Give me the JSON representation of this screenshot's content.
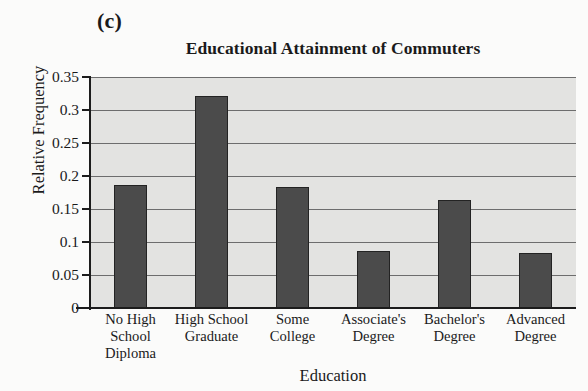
{
  "panel_letter": "(c)",
  "chart_data": {
    "type": "bar",
    "title": "Educational Attainment of Commuters",
    "xlabel": "Education",
    "ylabel": "Relative Frequency",
    "categories": [
      "No High School Diploma",
      "High School Graduate",
      "Some College",
      "Associate's Degree",
      "Bachelor's Degree",
      "Advanced Degree"
    ],
    "category_lines": [
      [
        "No High",
        "School",
        "Diploma"
      ],
      [
        "High School",
        "Graduate"
      ],
      [
        "Some",
        "College"
      ],
      [
        "Associate's",
        "Degree"
      ],
      [
        "Bachelor's",
        "Degree"
      ],
      [
        "Advanced",
        "Degree"
      ]
    ],
    "values": [
      0.187,
      0.321,
      0.184,
      0.087,
      0.163,
      0.084
    ],
    "ylim": [
      0,
      0.35
    ],
    "ytick_values": [
      0,
      0.05,
      0.1,
      0.15,
      0.2,
      0.25,
      0.3,
      0.35
    ],
    "ytick_labels": [
      "0",
      "0.05",
      "0.1",
      "0.15",
      "0.2",
      "0.25",
      "0.3",
      "0.35"
    ],
    "grid": true,
    "legend": null,
    "bar_color": "#4b4b4b",
    "bar_edge_color": "#232323",
    "plot_background": "#e3e3e1"
  }
}
